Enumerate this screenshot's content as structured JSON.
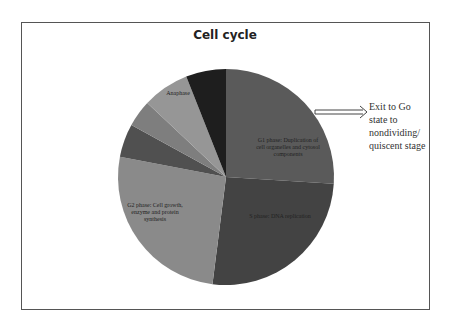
{
  "chart_data": {
    "type": "pie",
    "title": "Cell cycle",
    "start_angle_deg": 0,
    "direction": "clockwise",
    "slices": [
      {
        "label": "G1 phase: Duplication of cell organelles and cytosol components",
        "value": 26,
        "color": "#5a5a5a"
      },
      {
        "label": "S phase: DNA replication",
        "value": 26,
        "color": "#434343"
      },
      {
        "label": "G2 phase: Cell growth, enzyme and protein synthesis",
        "value": 26,
        "color": "#8a8a8a"
      },
      {
        "label": "",
        "value": 5,
        "color": "#505050"
      },
      {
        "label": "",
        "value": 4,
        "color": "#7e7e7e"
      },
      {
        "label": "Anaphase",
        "value": 7,
        "color": "#969696"
      },
      {
        "label": "",
        "value": 6,
        "color": "#1e1e1e"
      }
    ],
    "annotation": {
      "text": "Exit to Go state to nondividing/ quiscent stage",
      "arrow": "double-line arrow from G1 slice pointing right"
    }
  },
  "title": "Cell cycle",
  "labels": {
    "g1_line1": "G1 phase: Duplication of",
    "g1_line2": "cell organelles and cytosol",
    "g1_line3": "components",
    "s_line1": "S phase: DNA replication",
    "g2_line1": "G2 phase: Cell growth,",
    "g2_line2": "enzyme and protein",
    "g2_line3": "synthesis",
    "anaphase": "Anaphase"
  },
  "annotation": {
    "line1": "Exit to Go",
    "line2": "state to",
    "line3": "nondividing/",
    "line4": "quiscent stage"
  }
}
